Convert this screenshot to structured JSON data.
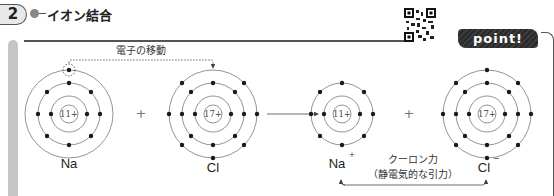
{
  "header": {
    "section_number": "2",
    "section_title": "イオン結合",
    "point_label": "point!"
  },
  "diagram": {
    "transfer_label": "電子の移動",
    "plus_sign": "+",
    "coulomb_label": "クーロン力",
    "coulomb_sublabel": "（静電気的な引力）",
    "atoms": [
      {
        "symbol": "Na",
        "charge": "",
        "nucleus": "11+",
        "shells": [
          2,
          8,
          1
        ]
      },
      {
        "symbol": "Cl",
        "charge": "",
        "nucleus": "17+",
        "shells": [
          2,
          8,
          7
        ]
      },
      {
        "symbol": "Na",
        "charge": "+",
        "nucleus": "11+",
        "shells": [
          2,
          8
        ]
      },
      {
        "symbol": "Cl",
        "charge": "−",
        "nucleus": "17+",
        "shells": [
          2,
          8,
          8
        ]
      }
    ]
  },
  "colors": {
    "line": "#555555",
    "dot": "#1a1a1a",
    "badge_bg": "#2f2f2f",
    "side_bar": "#c6c6c6"
  }
}
